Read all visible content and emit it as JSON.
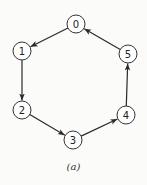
{
  "diagram": {
    "type": "directed-cycle-graph",
    "caption": "(a)",
    "node_radius": 9,
    "nodes": [
      {
        "id": "0",
        "label": "0",
        "x": 76,
        "y": 24
      },
      {
        "id": "1",
        "label": "1",
        "x": 22,
        "y": 51
      },
      {
        "id": "2",
        "label": "2",
        "x": 22,
        "y": 110
      },
      {
        "id": "3",
        "label": "3",
        "x": 73,
        "y": 140
      },
      {
        "id": "4",
        "label": "4",
        "x": 126,
        "y": 115
      },
      {
        "id": "5",
        "label": "5",
        "x": 128,
        "y": 54
      }
    ],
    "edges": [
      {
        "from": "0",
        "to": "1"
      },
      {
        "from": "1",
        "to": "2"
      },
      {
        "from": "2",
        "to": "3"
      },
      {
        "from": "3",
        "to": "4"
      },
      {
        "from": "4",
        "to": "5"
      },
      {
        "from": "5",
        "to": "0"
      }
    ],
    "colors": {
      "stroke": "#2a2a2a",
      "node_fill": "#ffffff",
      "background": "#fbfbf9"
    }
  }
}
